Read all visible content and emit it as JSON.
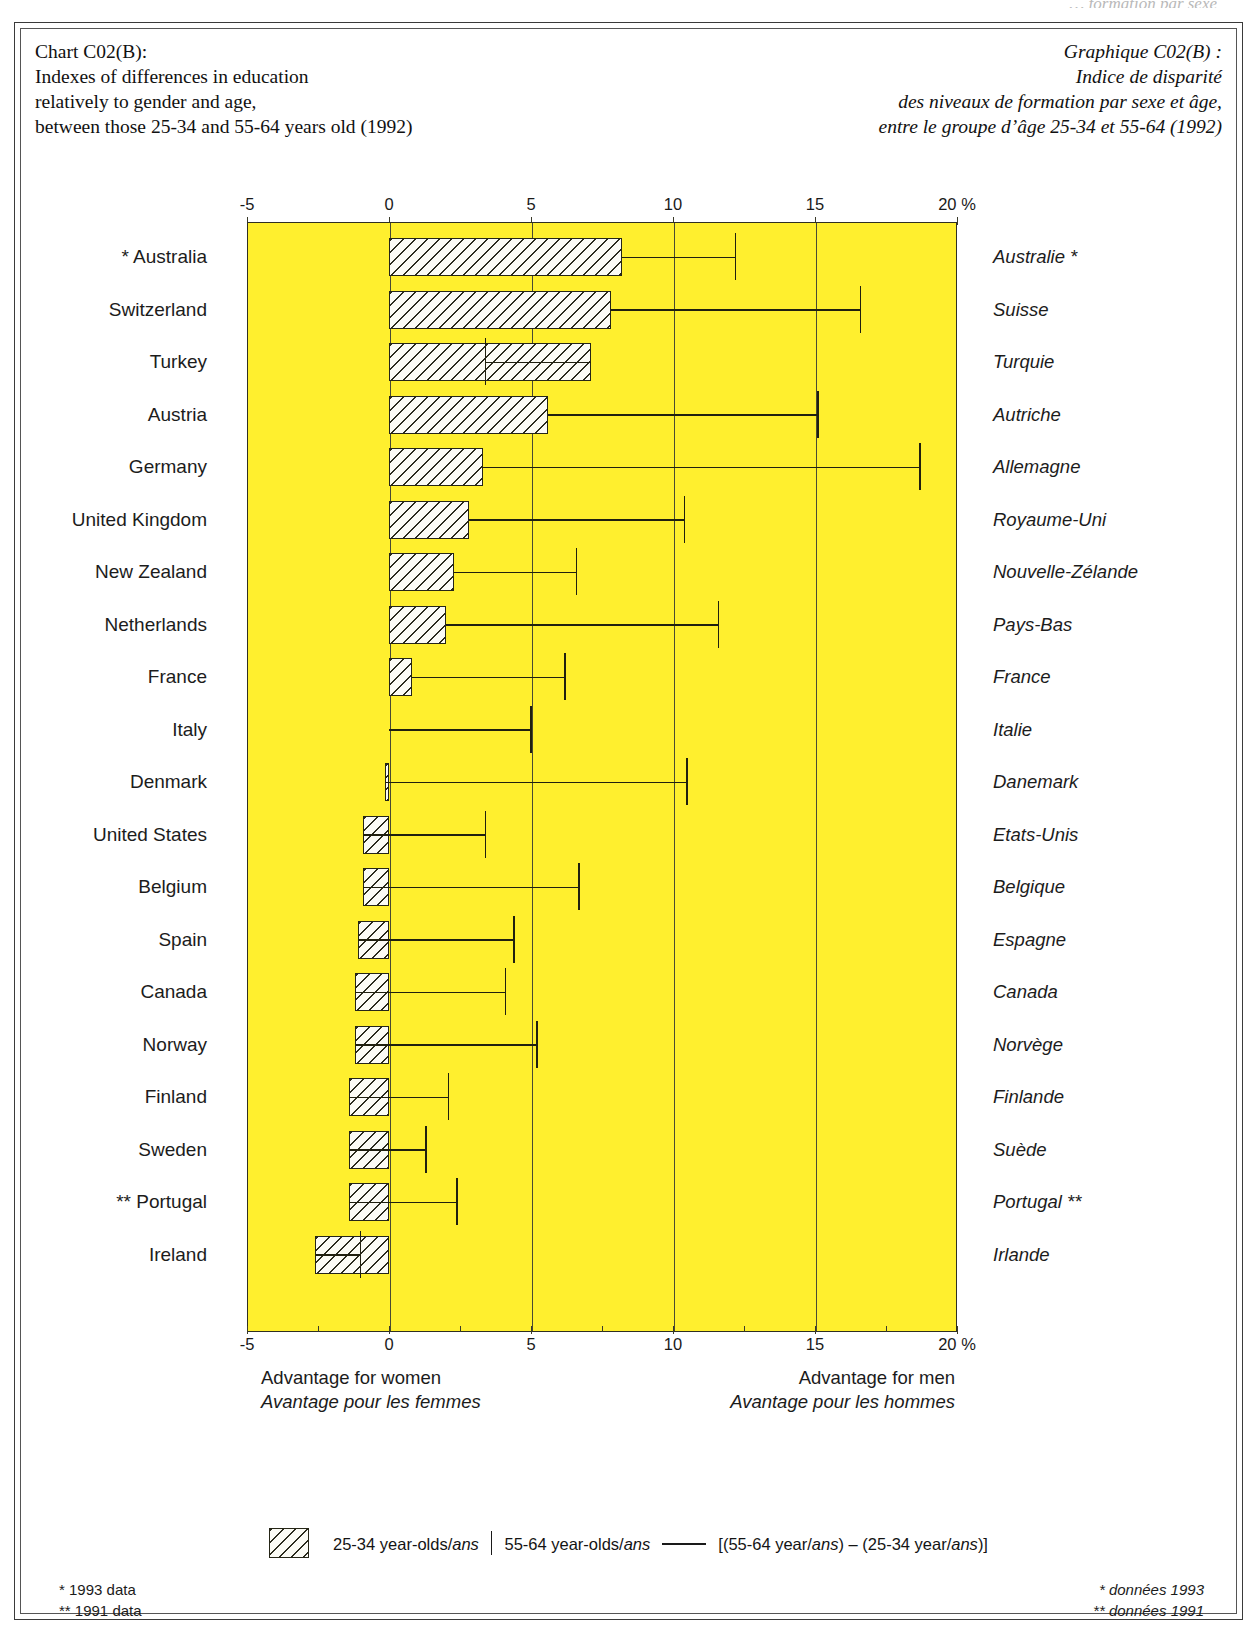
{
  "running_head": "… formation par sexe",
  "header": {
    "title_en": "Chart C02(B):\nIndexes of differences in education\nrelatively to gender and age,\nbetween those 25-34 and 55-64 years old (1992)",
    "title_fr": "Graphique C02(B) :\nIndice de disparité\ndes niveaux de formation par sexe et âge,\nentre le groupe d’âge 25-34 et 55-64 (1992)"
  },
  "axis": {
    "unit": "%",
    "ticks": [
      "-5",
      "0",
      "5",
      "10",
      "15",
      "20"
    ],
    "tick_values": [
      -5,
      0,
      5,
      10,
      15,
      20
    ]
  },
  "captions": {
    "left_en": "Advantage for women",
    "left_fr": "Avantage pour les femmes",
    "right_en": "Advantage for men",
    "right_fr": "Avantage pour les hommes"
  },
  "legend": {
    "swatch_label_a": "25-34 year-olds/",
    "swatch_label_a_it": "ans",
    "swatch_label_b": "55-64 year-olds/",
    "swatch_label_b_it": "ans",
    "line_label_pre": "[(55-64 year/",
    "line_label_it1": "ans",
    "line_label_mid": ") – (25-34 year/",
    "line_label_it2": "ans",
    "line_label_post": ")]"
  },
  "footnotes": {
    "left": "*  1993 data\n**  1991 data",
    "right": "*  données 1993\n**  données 1991"
  },
  "chart_data": {
    "type": "bar",
    "title": "Indexes of differences in education relatively to gender and age, between those 25-34 and 55-64 years old (1992)",
    "xlabel": "%",
    "ylabel": "",
    "xlim": [
      -5,
      20
    ],
    "grid": true,
    "orientation": "horizontal",
    "series": [
      {
        "name": "25-34 year-olds",
        "style": "hatched-bar"
      },
      {
        "name": "55-64 year-olds",
        "style": "tick-marker"
      }
    ],
    "categories": [
      "Australia",
      "Switzerland",
      "Turkey",
      "Austria",
      "Germany",
      "United Kingdom",
      "New Zealand",
      "Netherlands",
      "France",
      "Italy",
      "Denmark",
      "United States",
      "Belgium",
      "Spain",
      "Canada",
      "Norway",
      "Finland",
      "Sweden",
      "Portugal",
      "Ireland"
    ],
    "rows": [
      {
        "label_en": "* Australia",
        "label_fr": "Australie *",
        "v2534": 8.2,
        "v5564": 12.2,
        "footnote": "*"
      },
      {
        "label_en": "Switzerland",
        "label_fr": "Suisse",
        "v2534": 7.8,
        "v5564": 16.6,
        "footnote": ""
      },
      {
        "label_en": "Turkey",
        "label_fr": "Turquie",
        "v2534": 7.1,
        "v5564": 3.4,
        "footnote": ""
      },
      {
        "label_en": "Austria",
        "label_fr": "Autriche",
        "v2534": 5.6,
        "v5564": 15.1,
        "footnote": ""
      },
      {
        "label_en": "Germany",
        "label_fr": "Allemagne",
        "v2534": 3.3,
        "v5564": 18.7,
        "footnote": ""
      },
      {
        "label_en": "United Kingdom",
        "label_fr": "Royaume-Uni",
        "v2534": 2.8,
        "v5564": 10.4,
        "footnote": ""
      },
      {
        "label_en": "New Zealand",
        "label_fr": "Nouvelle-Zélande",
        "v2534": 2.3,
        "v5564": 6.6,
        "footnote": ""
      },
      {
        "label_en": "Netherlands",
        "label_fr": "Pays-Bas",
        "v2534": 2.0,
        "v5564": 11.6,
        "footnote": ""
      },
      {
        "label_en": "France",
        "label_fr": "France",
        "v2534": 0.8,
        "v5564": 6.2,
        "footnote": ""
      },
      {
        "label_en": "Italy",
        "label_fr": "Italie",
        "v2534": 0.0,
        "v5564": 5.0,
        "footnote": ""
      },
      {
        "label_en": "Denmark",
        "label_fr": "Danemark",
        "v2534": -0.15,
        "v5564": 10.5,
        "footnote": ""
      },
      {
        "label_en": "United States",
        "label_fr": "Etats-Unis",
        "v2534": -0.9,
        "v5564": 3.4,
        "footnote": ""
      },
      {
        "label_en": "Belgium",
        "label_fr": "Belgique",
        "v2534": -0.9,
        "v5564": 6.7,
        "footnote": ""
      },
      {
        "label_en": "Spain",
        "label_fr": "Espagne",
        "v2534": -1.1,
        "v5564": 4.4,
        "footnote": ""
      },
      {
        "label_en": "Canada",
        "label_fr": "Canada",
        "v2534": -1.2,
        "v5564": 4.1,
        "footnote": ""
      },
      {
        "label_en": "Norway",
        "label_fr": "Norvège",
        "v2534": -1.2,
        "v5564": 5.2,
        "footnote": ""
      },
      {
        "label_en": "Finland",
        "label_fr": "Finlande",
        "v2534": -1.4,
        "v5564": 2.1,
        "footnote": ""
      },
      {
        "label_en": "Sweden",
        "label_fr": "Suède",
        "v2534": -1.4,
        "v5564": 1.3,
        "footnote": ""
      },
      {
        "label_en": "** Portugal",
        "label_fr": "Portugal **",
        "v2534": -1.4,
        "v5564": 2.4,
        "footnote": "**"
      },
      {
        "label_en": "Ireland",
        "label_fr": "Irlande",
        "v2534": -2.6,
        "v5564": -1.0,
        "footnote": ""
      }
    ]
  }
}
